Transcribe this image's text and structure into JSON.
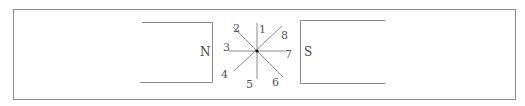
{
  "diagram": {
    "colors": {
      "line": "#8a8a8a",
      "frame": "#8c8c8c",
      "text": "#555555",
      "center": "#111111"
    },
    "poles": [
      {
        "id": "north",
        "label": "N"
      },
      {
        "id": "south",
        "label": "S"
      }
    ],
    "directions": [
      {
        "id": "1",
        "label": "1"
      },
      {
        "id": "2",
        "label": "2"
      },
      {
        "id": "3",
        "label": "3"
      },
      {
        "id": "4",
        "label": "4"
      },
      {
        "id": "5",
        "label": "5"
      },
      {
        "id": "6",
        "label": "6"
      },
      {
        "id": "7",
        "label": "7"
      },
      {
        "id": "8",
        "label": "8"
      }
    ]
  }
}
